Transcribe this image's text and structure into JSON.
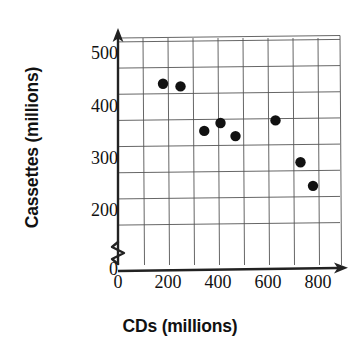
{
  "chart_data": {
    "type": "scatter",
    "title": "",
    "xlabel": "CDs (millions)",
    "ylabel": "Cassettes (millions)",
    "xlim": [
      0,
      880
    ],
    "ylim": [
      150,
      530
    ],
    "xticks": [
      0,
      200,
      400,
      600,
      800
    ],
    "yticks": [
      200,
      300,
      400,
      500
    ],
    "y_axis_break": true,
    "y_origin_label": "0",
    "grid": true,
    "legend": null,
    "marker": "filled-circle",
    "marker_color": "#111111",
    "points": [
      {
        "x": 180,
        "y": 445
      },
      {
        "x": 250,
        "y": 440
      },
      {
        "x": 345,
        "y": 355
      },
      {
        "x": 410,
        "y": 370
      },
      {
        "x": 470,
        "y": 345
      },
      {
        "x": 630,
        "y": 375
      },
      {
        "x": 730,
        "y": 295
      },
      {
        "x": 780,
        "y": 250
      }
    ]
  },
  "axes": {
    "x_title": "CDs (millions)",
    "y_title": "Cassettes (millions)",
    "x_tick_labels": [
      "0",
      "200",
      "400",
      "600",
      "800"
    ],
    "y_tick_labels": [
      "500",
      "400",
      "300",
      "200"
    ],
    "origin_label": "0"
  },
  "colors": {
    "marker": "#111111",
    "grid": "#555555",
    "axis": "#222222",
    "background": "#ffffff",
    "text": "#111111"
  }
}
